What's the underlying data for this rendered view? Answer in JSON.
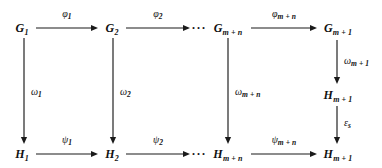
{
  "diagram": {
    "type": "commutative-diagram",
    "rows": [
      {
        "name": "top-row",
        "nodes": [
          {
            "id": "G1",
            "base": "G",
            "sub": "1",
            "x": 22,
            "y": 28
          },
          {
            "id": "G2",
            "base": "G",
            "sub": "2",
            "x": 112,
            "y": 28
          },
          {
            "id": "Gmn",
            "base": "G",
            "sub": "m + n",
            "x": 228,
            "y": 28
          },
          {
            "id": "Gm1",
            "base": "G",
            "sub": "m + 1",
            "x": 338,
            "y": 28
          }
        ],
        "ellipsis": {
          "text": "···",
          "x": 199,
          "y": 28
        }
      },
      {
        "name": "bottom-row",
        "nodes": [
          {
            "id": "H1",
            "base": "H",
            "sub": "1",
            "x": 22,
            "y": 154
          },
          {
            "id": "H2",
            "base": "H",
            "sub": "2",
            "x": 112,
            "y": 154
          },
          {
            "id": "Hmn",
            "base": "H",
            "sub": "m + n",
            "x": 228,
            "y": 154
          },
          {
            "id": "Hm1",
            "base": "H",
            "sub": "m + 1",
            "x": 338,
            "y": 154
          }
        ],
        "ellipsis": {
          "text": "···",
          "x": 199,
          "y": 154
        }
      }
    ],
    "extra_nodes": [
      {
        "id": "Hm1_mid",
        "base": "H",
        "sub": "m + 1",
        "x": 338,
        "y": 95
      }
    ],
    "horizontal_arrows": [
      {
        "id": "phi1",
        "label_base": "φ",
        "label_sub": "1",
        "x1": 36,
        "y1": 28,
        "x2": 98,
        "y2": 28,
        "lx": 67,
        "ly": 13
      },
      {
        "id": "phi2",
        "label_base": "φ",
        "label_sub": "2",
        "x1": 126,
        "y1": 28,
        "x2": 190,
        "y2": 28,
        "lx": 158,
        "ly": 13
      },
      {
        "id": "phimn",
        "label_base": "φ",
        "label_sub": "m + n",
        "x1": 251,
        "y1": 28,
        "x2": 317,
        "y2": 28,
        "lx": 284,
        "ly": 13
      },
      {
        "id": "psi1",
        "label_base": "ψ",
        "label_sub": "1",
        "x1": 36,
        "y1": 154,
        "x2": 98,
        "y2": 154,
        "lx": 67,
        "ly": 139
      },
      {
        "id": "psi2",
        "label_base": "ψ",
        "label_sub": "2",
        "x1": 126,
        "y1": 154,
        "x2": 190,
        "y2": 154,
        "lx": 158,
        "ly": 139
      },
      {
        "id": "psimn",
        "label_base": "ψ",
        "label_sub": "m + n",
        "x1": 251,
        "y1": 154,
        "x2": 317,
        "y2": 154,
        "lx": 284,
        "ly": 139
      }
    ],
    "vertical_arrows": [
      {
        "id": "omega1",
        "label_base": "ω",
        "label_sub": "1",
        "x1": 24,
        "y1": 38,
        "x2": 24,
        "y2": 144,
        "lx": 31,
        "ly": 91
      },
      {
        "id": "omega2",
        "label_base": "ω",
        "label_sub": "2",
        "x1": 113,
        "y1": 38,
        "x2": 113,
        "y2": 144,
        "lx": 120,
        "ly": 91
      },
      {
        "id": "omegamn",
        "label_base": "ω",
        "label_sub": "m + n",
        "x1": 228,
        "y1": 38,
        "x2": 228,
        "y2": 144,
        "lx": 235,
        "ly": 91
      },
      {
        "id": "omegam1",
        "label_base": "ω",
        "label_sub": "m + 1",
        "x1": 337,
        "y1": 40,
        "x2": 337,
        "y2": 84,
        "lx": 344,
        "ly": 60
      },
      {
        "id": "epsilon",
        "label_base": "ε",
        "label_sub": "s",
        "x1": 337,
        "y1": 106,
        "x2": 337,
        "y2": 144,
        "lx": 344,
        "ly": 122
      }
    ],
    "colors": {
      "stroke": "#1a1a1a",
      "text": "#111111",
      "background": "#ffffff"
    }
  }
}
